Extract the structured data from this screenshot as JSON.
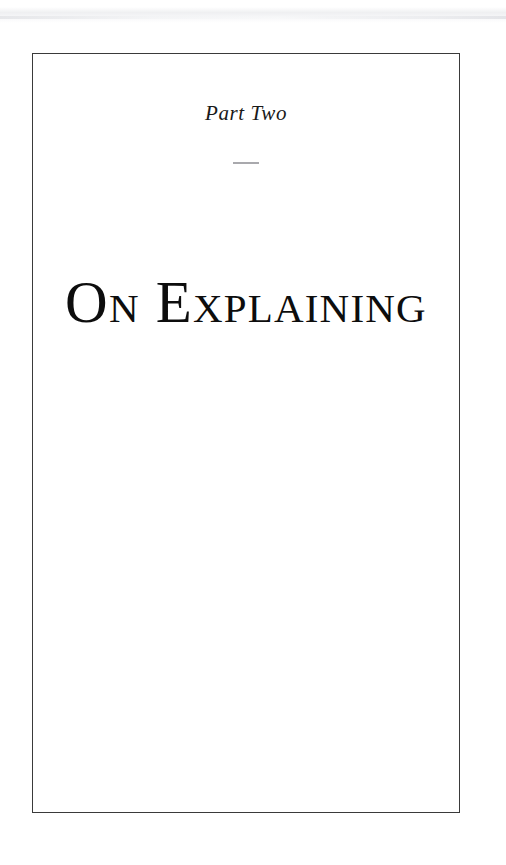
{
  "page": {
    "kind": "book-part-title-page",
    "background_color": "#ffffff",
    "frame": {
      "border_color": "#3a3a3a",
      "border_width_px": 1.5
    },
    "artifact": {
      "name": "scan-edge-band",
      "color": "#ecedef"
    }
  },
  "part": {
    "label": "Part Two",
    "divider": {
      "glyph": "—",
      "color": "#a9a9ad",
      "width_px": 26
    },
    "title": "On Explaining",
    "title_color": "#0d0d0d",
    "label_color": "#191919"
  },
  "body": {
    "content": ""
  }
}
